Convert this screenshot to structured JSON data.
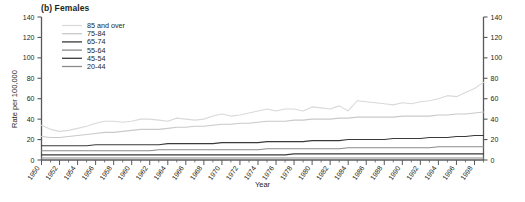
{
  "panel": {
    "title": "(b) Females"
  },
  "axes": {
    "y_label": "Rate per 100,000",
    "x_label": "Year",
    "y_ticks": [
      0,
      20,
      40,
      60,
      80,
      100,
      120,
      140
    ],
    "y_ticks_right": [
      0,
      20,
      40,
      60,
      80,
      100,
      120,
      140
    ],
    "x_ticks": [
      1950,
      1952,
      1954,
      1956,
      1958,
      1960,
      1962,
      1964,
      1966,
      1968,
      1970,
      1972,
      1974,
      1976,
      1978,
      1980,
      1982,
      1984,
      1986,
      1988,
      1990,
      1992,
      1994,
      1996,
      1998
    ],
    "ylim": [
      0,
      140
    ],
    "xlim": [
      1950,
      1999
    ],
    "grid": false
  },
  "legend": {
    "position": "top-left-inside",
    "entries": [
      {
        "label": "85 and over",
        "color": "#d9d9d9"
      },
      {
        "label": "75-84",
        "color": "#c9c9c9"
      },
      {
        "label": "65-74",
        "color": "#3a3a3a"
      },
      {
        "label": "55-64",
        "color": "#8a8a8a"
      },
      {
        "label": "45-54",
        "color": "#3a3a3a"
      },
      {
        "label": "20-44",
        "color": "#8a8a8a"
      }
    ]
  },
  "chart_data": {
    "type": "line",
    "title": "(b) Females",
    "xlabel": "Year",
    "ylabel": "Rate per 100,000",
    "ylim": [
      0,
      140
    ],
    "xlim": [
      1950,
      1999
    ],
    "grid": false,
    "x": [
      1950,
      1951,
      1952,
      1953,
      1954,
      1955,
      1956,
      1957,
      1958,
      1959,
      1960,
      1961,
      1962,
      1963,
      1964,
      1965,
      1966,
      1967,
      1968,
      1969,
      1970,
      1971,
      1972,
      1973,
      1974,
      1975,
      1976,
      1977,
      1978,
      1979,
      1980,
      1981,
      1982,
      1983,
      1984,
      1985,
      1986,
      1987,
      1988,
      1989,
      1990,
      1991,
      1992,
      1993,
      1994,
      1995,
      1996,
      1997,
      1998,
      1999
    ],
    "series": [
      {
        "name": "85 and over",
        "color": "#d9d9d9",
        "values": [
          34,
          30,
          28,
          29,
          31,
          33,
          36,
          38,
          38,
          37,
          38,
          40,
          40,
          39,
          38,
          41,
          40,
          39,
          40,
          43,
          45,
          43,
          44,
          46,
          48,
          50,
          48,
          50,
          50,
          48,
          52,
          51,
          50,
          53,
          48,
          58,
          57,
          56,
          55,
          54,
          56,
          55,
          57,
          58,
          60,
          63,
          62,
          66,
          70,
          76
        ]
      },
      {
        "name": "75-84",
        "color": "#c9c9c9",
        "values": [
          23,
          22,
          22,
          23,
          24,
          25,
          26,
          27,
          27,
          28,
          29,
          30,
          30,
          30,
          31,
          32,
          32,
          33,
          33,
          34,
          35,
          35,
          36,
          36,
          37,
          38,
          38,
          38,
          39,
          39,
          40,
          40,
          40,
          41,
          41,
          42,
          42,
          42,
          42,
          42,
          43,
          43,
          43,
          43,
          44,
          44,
          45,
          45,
          46,
          47
        ]
      },
      {
        "name": "65-74",
        "color": "#3a3a3a",
        "values": [
          14,
          14,
          14,
          14,
          14,
          14,
          15,
          15,
          15,
          15,
          15,
          15,
          15,
          15,
          16,
          16,
          16,
          16,
          16,
          16,
          17,
          17,
          17,
          17,
          17,
          18,
          18,
          18,
          18,
          18,
          19,
          19,
          19,
          19,
          20,
          20,
          20,
          20,
          20,
          21,
          21,
          21,
          21,
          22,
          22,
          22,
          23,
          23,
          24,
          24
        ]
      },
      {
        "name": "55-64",
        "color": "#8a8a8a",
        "values": [
          9,
          9,
          9,
          9,
          9,
          9,
          9,
          9,
          9,
          9,
          9,
          9,
          9,
          10,
          10,
          10,
          10,
          10,
          10,
          10,
          10,
          10,
          10,
          10,
          10,
          11,
          11,
          11,
          11,
          11,
          11,
          11,
          11,
          11,
          12,
          12,
          12,
          12,
          12,
          12,
          12,
          12,
          12,
          12,
          13,
          13,
          13,
          13,
          13,
          13
        ]
      },
      {
        "name": "45-54",
        "color": "#3a3a3a",
        "values": [
          5,
          5,
          5,
          5,
          5,
          5,
          5,
          5,
          5,
          5,
          5,
          5,
          5,
          5,
          5,
          5,
          5,
          5,
          5,
          5,
          5,
          5,
          5,
          5,
          5,
          5,
          5,
          5,
          6,
          6,
          6,
          6,
          6,
          6,
          6,
          6,
          6,
          6,
          6,
          6,
          6,
          6,
          6,
          6,
          6,
          6,
          6,
          6,
          6,
          6
        ]
      },
      {
        "name": "20-44",
        "color": "#8a8a8a",
        "values": [
          2,
          2,
          2,
          2,
          2,
          2,
          2,
          2,
          2,
          2,
          2,
          2,
          2,
          2,
          2,
          2,
          2,
          2,
          2,
          2,
          2,
          2,
          2,
          2,
          2,
          2,
          2,
          2,
          2,
          2,
          2,
          2,
          2,
          2,
          2,
          2,
          2,
          2,
          2,
          2,
          2,
          2,
          2,
          2,
          2,
          2,
          2,
          2,
          2,
          2
        ]
      }
    ]
  }
}
